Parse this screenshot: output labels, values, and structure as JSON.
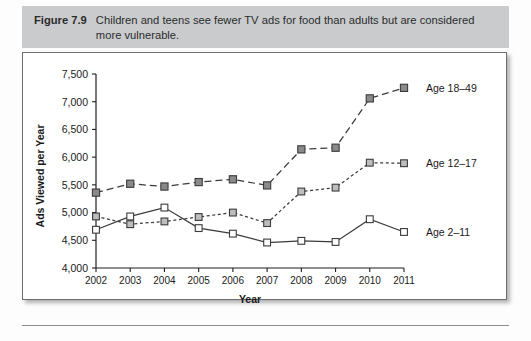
{
  "figure": {
    "label": "Figure 7.9",
    "caption": "Children and teens see fewer TV ads for food than adults but are considered more vulnerable."
  },
  "chart_data": {
    "type": "line",
    "title": "",
    "xlabel": "Year",
    "ylabel": "Ads Viewed per Year",
    "categories": [
      "2002",
      "2003",
      "2004",
      "2005",
      "2006",
      "2007",
      "2008",
      "2009",
      "2010",
      "2011"
    ],
    "x": [
      2002,
      2003,
      2004,
      2005,
      2006,
      2007,
      2008,
      2009,
      2010,
      2011
    ],
    "ylim": [
      4000,
      7500
    ],
    "yticks": [
      4000,
      4500,
      5000,
      5500,
      6000,
      6500,
      7000,
      7500
    ],
    "ytick_labels": [
      "4,000",
      "4,500",
      "5,000",
      "5,500",
      "6,000",
      "6,500",
      "7,000",
      "7,500"
    ],
    "grid": false,
    "legend_position": "right-outside",
    "series": [
      {
        "name": "Age 18–49",
        "values": [
          5360,
          5520,
          5470,
          5550,
          5600,
          5490,
          6140,
          6170,
          7060,
          7250
        ],
        "marker": "filled-square",
        "marker_color": "#8a8a8a",
        "line_style": "dashed",
        "line_color": "#3b3b3b"
      },
      {
        "name": "Age 12–17",
        "values": [
          4930,
          4790,
          4840,
          4920,
          5000,
          4810,
          5380,
          5450,
          5900,
          5890
        ],
        "marker": "light-square",
        "marker_color": "#bdbdbd",
        "line_style": "dotted",
        "line_color": "#3b3b3b"
      },
      {
        "name": "Age 2–11",
        "values": [
          4690,
          4930,
          5090,
          4720,
          4620,
          4460,
          4490,
          4470,
          4880,
          4650
        ],
        "marker": "open-square",
        "marker_color": "#ffffff",
        "line_style": "solid",
        "line_color": "#3b3b3b"
      }
    ]
  },
  "colors": {
    "caption_band": "#c9cbcd",
    "frame_border": "#6e6e6e",
    "axis": "#1f1f1f",
    "series_dark": "#8a8a8a",
    "series_light": "#bdbdbd",
    "series_open": "#ffffff"
  }
}
